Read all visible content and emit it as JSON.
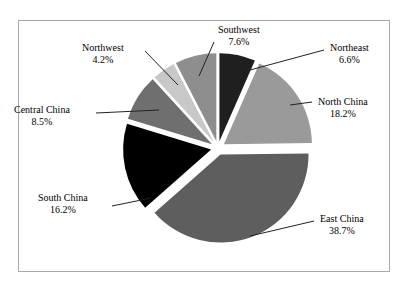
{
  "chart_data": {
    "type": "pie",
    "title": "",
    "subtitle": "",
    "legend": "none",
    "grid": false,
    "exploded": true,
    "categories": [
      "Northeast",
      "North China",
      "East China",
      "South China",
      "Central China",
      "Northwest",
      "Southwest"
    ],
    "values": [
      6.6,
      18.2,
      38.7,
      16.2,
      8.5,
      4.2,
      7.6
    ],
    "unit": "%",
    "slices": [
      {
        "label": "Northeast",
        "value": 6.6,
        "value_text": "6.6%",
        "color": "#1f1f1f",
        "start_angle": 0,
        "end_angle": 23.76,
        "label_x": 330,
        "label_y": 42
      },
      {
        "label": "North China",
        "value": 18.2,
        "value_text": "18.2%",
        "color": "#9a9a9a",
        "start_angle": 23.76,
        "end_angle": 89.28,
        "label_x": 318,
        "label_y": 96
      },
      {
        "label": "East China",
        "value": 38.7,
        "value_text": "38.7%",
        "color": "#5e5e5e",
        "start_angle": 89.28,
        "end_angle": 228.6,
        "label_x": 320,
        "label_y": 213
      },
      {
        "label": "South China",
        "value": 16.2,
        "value_text": "16.2%",
        "color": "#000000",
        "start_angle": 228.6,
        "end_angle": 286.92,
        "label_x": 38,
        "label_y": 192
      },
      {
        "label": "Central China",
        "value": 8.5,
        "value_text": "8.5%",
        "color": "#6f6f6f",
        "start_angle": 286.92,
        "end_angle": 317.52,
        "label_x": 14,
        "label_y": 104
      },
      {
        "label": "Northwest",
        "value": 4.2,
        "value_text": "4.2%",
        "color": "#c8c8c8",
        "start_angle": 317.52,
        "end_angle": 332.64,
        "label_x": 82,
        "label_y": 42
      },
      {
        "label": "Southwest",
        "value": 7.6,
        "value_text": "7.6%",
        "color": "#8e8e8e",
        "start_angle": 332.64,
        "end_angle": 360,
        "label_x": 218,
        "label_y": 24
      }
    ],
    "geometry": {
      "center_x": 218,
      "center_y": 148,
      "radius": 88,
      "explode_offset": 7
    },
    "leader_lines": [
      {
        "name": "northeast-leader",
        "x1": 239,
        "y1": 73,
        "x2": 324,
        "y2": 50
      },
      {
        "name": "north-china-leader",
        "x1": 290,
        "y1": 105,
        "x2": 312,
        "y2": 102
      },
      {
        "name": "east-china-leader",
        "x1": 250,
        "y1": 236,
        "x2": 314,
        "y2": 221
      },
      {
        "name": "south-china-leader",
        "x1": 151,
        "y1": 198,
        "x2": 112,
        "y2": 206
      },
      {
        "name": "central-china-leader",
        "x1": 159,
        "y1": 110,
        "x2": 96,
        "y2": 113
      },
      {
        "name": "northwest-leader",
        "x1": 178,
        "y1": 85,
        "x2": 145,
        "y2": 51
      },
      {
        "name": "southwest-leader",
        "x1": 199,
        "y1": 76,
        "x2": 214,
        "y2": 42
      }
    ],
    "colors": {
      "border": "#a8a8a8",
      "background": "#ffffff",
      "leader_line": "#222222",
      "text": "#000000"
    }
  }
}
